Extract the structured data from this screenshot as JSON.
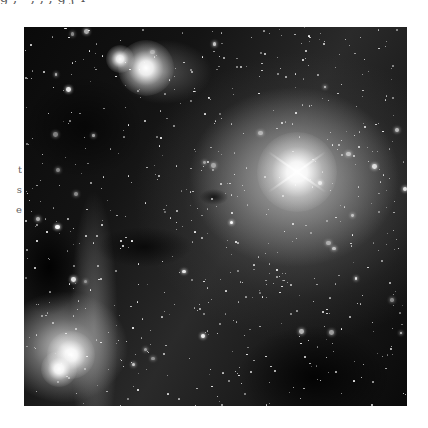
{
  "page": {
    "top_text_fragment": "ɡ  ,  ʼ     ,      ,             ,                                    ɡ ʃ ʏ",
    "side_text_fragments": [
      "t",
      "s",
      "e"
    ]
  },
  "photo": {
    "alt": "Grayscale astronomical photograph of a star field with bright nebulosity, two bright stars with diffraction spikes, dark dust lanes, and a bright emission region at lower left",
    "bright_stars": [
      {
        "x": 122,
        "y": 41,
        "r": 28
      },
      {
        "x": 96,
        "y": 32,
        "r": 14
      },
      {
        "x": 273,
        "y": 145,
        "r": 40
      },
      {
        "x": 47,
        "y": 328,
        "r": 24
      },
      {
        "x": 35,
        "y": 342,
        "r": 18
      }
    ]
  }
}
